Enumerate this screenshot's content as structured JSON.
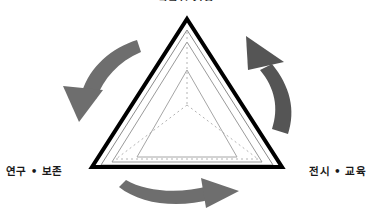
{
  "diagram": {
    "kind": "triangle-cycle-diagram",
    "title_partial_cropped": "박물관 기능",
    "background_color": "#ffffff",
    "outer_triangle": {
      "name": "outer-triangle",
      "stroke_color": "#000000",
      "stroke_width": 4,
      "fill": "none"
    },
    "nested_triangles": [
      {
        "name": "nested-triangle-1",
        "stroke_color": "#8a8a8a",
        "stroke_width": 1
      },
      {
        "name": "nested-triangle-2",
        "stroke_color": "#9a9a9a",
        "stroke_width": 1
      },
      {
        "name": "nested-triangle-3",
        "stroke_color": "#a6a6a6",
        "stroke_width": 1
      }
    ],
    "dashed_guides": {
      "name": "center-spokes",
      "stroke_color": "#b4b4b4",
      "stroke_width": 1,
      "dash_pattern": "2 3",
      "spoke_count": 3
    },
    "arrows": [
      {
        "id": "arrow-left",
        "direction": "down-left",
        "color": "#6e6e6e",
        "meaning": "수집 → 연구·보존"
      },
      {
        "id": "arrow-right",
        "direction": "up-left",
        "color": "#555555",
        "meaning": "전시·교육 → 수집"
      },
      {
        "id": "arrow-bottom",
        "direction": "right",
        "color": "#6e6e6e",
        "meaning": "연구·보존 → 전시·교육"
      }
    ],
    "labels": {
      "top": "박물관 기능",
      "left": "연구 • 보존",
      "right": "전시 • 교육"
    }
  }
}
